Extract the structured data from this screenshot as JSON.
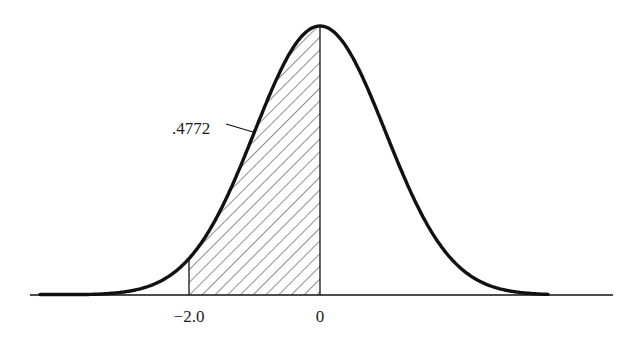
{
  "chart_data": {
    "type": "area",
    "title": "",
    "distribution": "standard-normal",
    "shaded_region": {
      "from": -2.0,
      "to": 0,
      "area": 0.4772,
      "fill": "diagonal-hatch"
    },
    "annotations": [
      {
        "text": ".4772",
        "points_to": "shaded-area"
      }
    ],
    "x_tick_labels": [
      "-2.0",
      "0"
    ],
    "x_ticks": [
      -2.0,
      0
    ],
    "xlim": [
      -4.4,
      4.5
    ],
    "grid": false,
    "legend": null,
    "xlabel": "",
    "ylabel": ""
  },
  "labels": {
    "area_value": ".4772",
    "tick_minus_two": "−2.0",
    "tick_zero": "0"
  },
  "colors": {
    "curve": "#111111",
    "hatch": "#333333",
    "background": "#ffffff"
  }
}
